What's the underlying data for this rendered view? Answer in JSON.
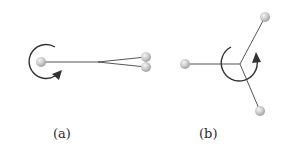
{
  "figure": {
    "panels": [
      {
        "id": "a",
        "label": "(a)",
        "description": "Linear configuration: one atom connected to two nearly overlapping atoms, with a rotation arrow around the single atom",
        "atoms": [
          {
            "x": 41,
            "y": 62
          },
          {
            "x": 146,
            "y": 57
          },
          {
            "x": 146,
            "y": 67
          }
        ],
        "rotation": "clockwise arrow encircling left atom"
      },
      {
        "id": "b",
        "label": "(b)",
        "description": "Trigonal configuration: three atoms bonded to a central vertex, with a rotation arrow around the center",
        "atoms": [
          {
            "x": 185,
            "y": 64
          },
          {
            "x": 265,
            "y": 17
          },
          {
            "x": 260,
            "y": 111
          }
        ],
        "center": {
          "x": 240,
          "y": 64
        },
        "rotation": "counterclockwise arrow encircling central vertex"
      }
    ],
    "colors": {
      "line": "#555555",
      "atom_fill": "#c8c8c8",
      "atom_highlight": "#eeeeee",
      "arrow": "#333333",
      "text": "#2a2a2a"
    }
  }
}
